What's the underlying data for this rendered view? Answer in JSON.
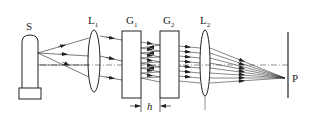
{
  "diagram": {
    "type": "optical-setup",
    "components": {
      "source": {
        "label": "S"
      },
      "lens1": {
        "label": "L",
        "sub": "1"
      },
      "plate1": {
        "label": "G",
        "sub": "1"
      },
      "plate2": {
        "label": "G",
        "sub": "2"
      },
      "lens2": {
        "label": "L",
        "sub": "2"
      },
      "screen_point": {
        "label": "P"
      },
      "gap": {
        "label": "h"
      }
    },
    "colors": {
      "stroke": "#222222",
      "background": "#ffffff"
    }
  }
}
